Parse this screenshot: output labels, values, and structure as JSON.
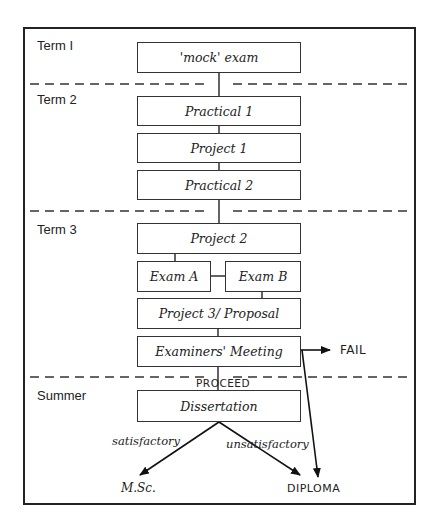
{
  "diagram": {
    "terms": [
      "Term I",
      "Term 2",
      "Term 3",
      "Summer"
    ],
    "boxes": {
      "mock_exam": "'mock' exam",
      "practical1": "Practical 1",
      "project1": "Project 1",
      "practical2": "Practical 2",
      "project2": "Project 2",
      "exam_a": "Exam A",
      "exam_b": "Exam B",
      "project3": "Project 3/ Proposal",
      "examiners_meeting": "Examiners' Meeting",
      "dissertation": "Dissertation"
    },
    "labels": {
      "proceed": "PROCEED",
      "fail": "FAIL",
      "satisfactory": "satisfactory",
      "unsatisfactory": "unsatisfactory",
      "msc": "M.Sc.",
      "diploma": "DIPLOMA"
    }
  }
}
